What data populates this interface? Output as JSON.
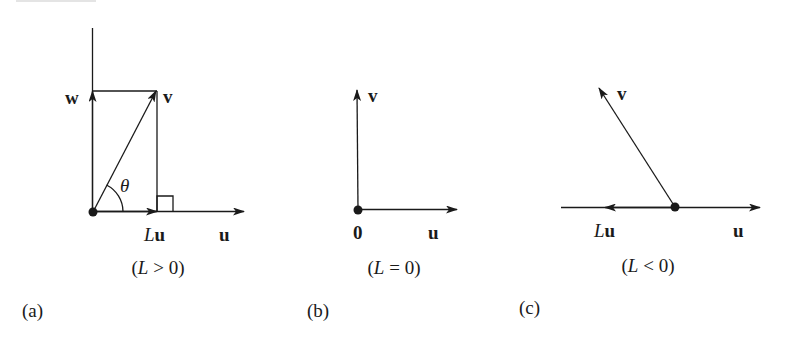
{
  "figure": {
    "panels": [
      {
        "id": "a",
        "panel_label": "(a)",
        "caption": {
          "open": "(",
          "var": "L",
          "rel": " > 0)"
        },
        "labels": {
          "w": "w",
          "v": "v",
          "theta": "θ",
          "Lu_L": "L",
          "Lu_u": "u",
          "u": "u"
        }
      },
      {
        "id": "b",
        "panel_label": "(b)",
        "caption": {
          "open": "(",
          "var": "L",
          "rel": " = 0)"
        },
        "labels": {
          "v": "v",
          "zero": "0",
          "u": "u"
        }
      },
      {
        "id": "c",
        "panel_label": "(c)",
        "caption": {
          "open": "(",
          "var": "L",
          "rel": " < 0)"
        },
        "labels": {
          "v": "v",
          "Lu_L": "L",
          "Lu_u": "u",
          "u": "u"
        }
      }
    ],
    "colors": {
      "stroke": "#1a1a1a",
      "background": "#ffffff"
    }
  }
}
